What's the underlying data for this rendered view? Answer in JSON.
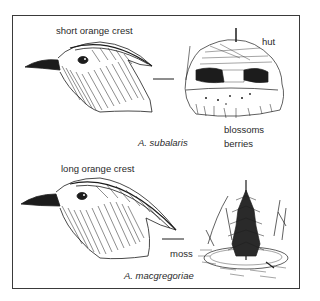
{
  "figure": {
    "panels": [
      {
        "species": "A. subalaris",
        "crest_label": "short orange crest",
        "bower_labels": [
          "hut",
          "blossoms",
          "berries"
        ],
        "bower_type": "hut"
      },
      {
        "species": "A. macgregoriae",
        "crest_label": "long orange crest",
        "bower_labels": [
          "moss"
        ],
        "bower_type": "maypole"
      }
    ]
  },
  "colors": {
    "ink": "#1c1c1c",
    "frame": "#3a3a3a",
    "background": "#ffffff"
  }
}
